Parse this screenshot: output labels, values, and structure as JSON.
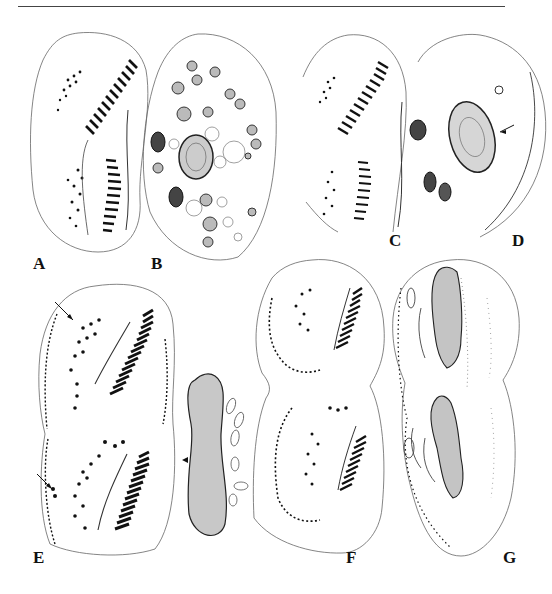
{
  "page": {
    "header_rule": true,
    "header_text": ""
  },
  "figure": {
    "panels": [
      {
        "id": "A",
        "label": "A",
        "description": "Ventral view, infraciliature of proter and opisthe"
      },
      {
        "id": "B",
        "label": "B",
        "description": "Nuclear apparatus with macronuclear nodules and micronuclei"
      },
      {
        "id": "C",
        "label": "C",
        "description": "Ventral view, infraciliature of divider"
      },
      {
        "id": "D",
        "label": "D",
        "description": "Dorsal view with macronucleus (arrow)"
      },
      {
        "id": "E",
        "label": "E",
        "description": "Ventral view of divider, arrows marking cirri; macronucleus (arrowhead)"
      },
      {
        "id": "F",
        "label": "F",
        "description": "Ventral view of late divider"
      },
      {
        "id": "G",
        "label": "G",
        "description": "Dorsal view of late divider with dividing macronucleus"
      }
    ]
  },
  "colors": {
    "ink": "#1a1a1a",
    "outline": "#555555",
    "stipple": "#888888",
    "background": "#ffffff"
  }
}
